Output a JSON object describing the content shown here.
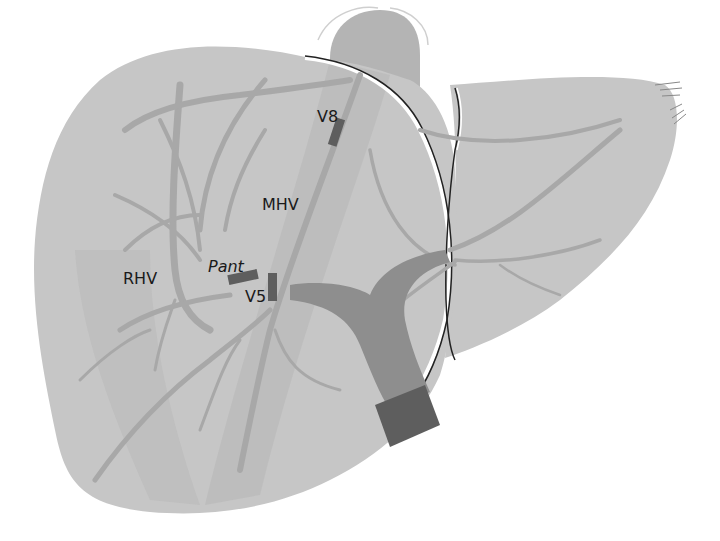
{
  "diagram": {
    "labels": {
      "v8": "V8",
      "mhv": "MHV",
      "rhv": "RHV",
      "pant": "Pant",
      "v5": "V5"
    },
    "colors": {
      "background": "#ffffff",
      "liver_fill": "#c6c6c6",
      "liver_right_shade": "#bdbdbd",
      "vessel_light": "#a8a8a8",
      "vessel_mid": "#999999",
      "portal_trunk": "#8e8e8e",
      "marker_dark": "#5e5e5e",
      "ivc": "#b4b4b4",
      "outline": "#222222",
      "label_text": "#1a1a1a"
    }
  }
}
